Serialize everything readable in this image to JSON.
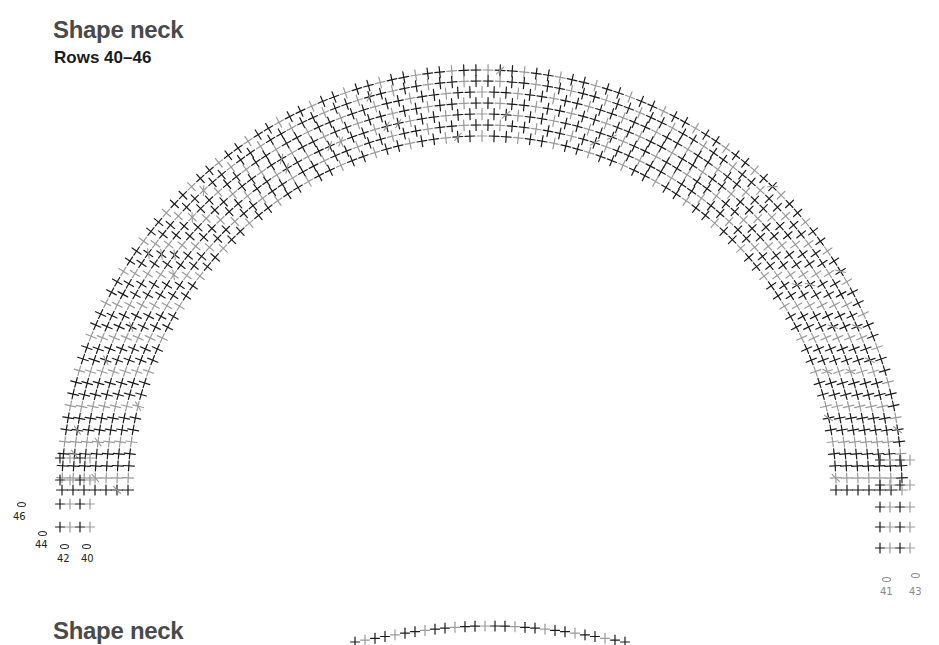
{
  "section1": {
    "title": "Shape neck",
    "subtitle": "Rows 40–46"
  },
  "section2": {
    "title": "Shape neck"
  },
  "diagram": {
    "type": "crochet-stitch-chart",
    "colors": {
      "dark": "#1a1a1a",
      "light": "#9a9a9a"
    },
    "arc": {
      "cx": 482,
      "cy": 470,
      "rows": 7,
      "r_inner": 385,
      "row_spacing": 12,
      "start_deg": 182,
      "end_deg": -2
    },
    "left_labels": [
      {
        "text": "46",
        "x": 13,
        "y": 511,
        "shade": "dark"
      },
      {
        "text": "44",
        "x": 35,
        "y": 539,
        "shade": "dark"
      },
      {
        "text": "42",
        "x": 57,
        "y": 553,
        "shade": "dark"
      },
      {
        "text": "40",
        "x": 81,
        "y": 553,
        "shade": "dark"
      }
    ],
    "left_chain_marks": [
      {
        "x": 17,
        "y": 502,
        "shade": "dark"
      },
      {
        "x": 38,
        "y": 531,
        "shade": "dark"
      },
      {
        "x": 60,
        "y": 544,
        "shade": "dark"
      },
      {
        "x": 82,
        "y": 544,
        "shade": "dark"
      }
    ],
    "right_labels": [
      {
        "text": "41",
        "x": 880,
        "y": 586,
        "shade": "grey"
      },
      {
        "text": "43",
        "x": 909,
        "y": 586,
        "shade": "grey"
      }
    ],
    "right_chain_marks": [
      {
        "x": 882,
        "y": 577,
        "shade": "grey"
      },
      {
        "x": 911,
        "y": 573,
        "shade": "grey"
      }
    ]
  }
}
